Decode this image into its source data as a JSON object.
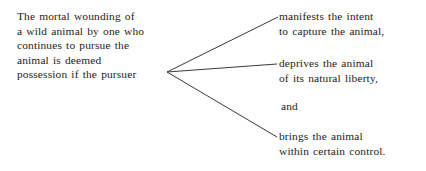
{
  "diagram": {
    "type": "argument-branch-diagram",
    "background_color": "#ffffff",
    "text_color": "#1c1c1c",
    "line_color": "#3a3a3a",
    "premise": {
      "lines": [
        "The mortal wounding of",
        "a wild animal by one who",
        "continues to pursue the",
        "animal is deemed",
        "possession if the pursuer"
      ]
    },
    "branches": [
      {
        "lines": [
          "manifests the intent",
          "to capture the animal,"
        ]
      },
      {
        "lines": [
          "deprives the animal",
          "of its natural liberty,"
        ]
      },
      {
        "lines": [
          "brings the animal",
          "within certain control."
        ]
      }
    ],
    "conjunction": {
      "text": "and"
    },
    "connectors": {
      "origin": {
        "x": 167,
        "y": 72
      },
      "endpoints": [
        {
          "x": 278,
          "y": 17
        },
        {
          "x": 277,
          "y": 64
        },
        {
          "x": 277,
          "y": 137
        }
      ]
    }
  }
}
